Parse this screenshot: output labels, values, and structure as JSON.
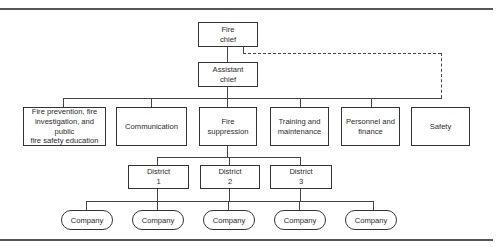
{
  "diagram": {
    "type": "organizational chart",
    "level1": {
      "label": "Fire\nchief"
    },
    "level2": {
      "label": "Assistant\nchief"
    },
    "divisions": [
      {
        "label": "Fire prevention, fire\ninvestigation, and public\nfire safety education"
      },
      {
        "label": "Communication"
      },
      {
        "label": "Fire\nsuppression"
      },
      {
        "label": "Training and\nmaintenance"
      },
      {
        "label": "Personnel and\nfinance"
      },
      {
        "label": "Safety"
      }
    ],
    "districts": [
      {
        "label": "District\n1"
      },
      {
        "label": "District\n2"
      },
      {
        "label": "District\n3"
      }
    ],
    "companies": [
      {
        "label": "Company"
      },
      {
        "label": "Company"
      },
      {
        "label": "Company"
      },
      {
        "label": "Company"
      },
      {
        "label": "Company"
      }
    ],
    "dashed_link": {
      "from": "Fire chief",
      "to": "Safety",
      "style": "dashed"
    }
  }
}
